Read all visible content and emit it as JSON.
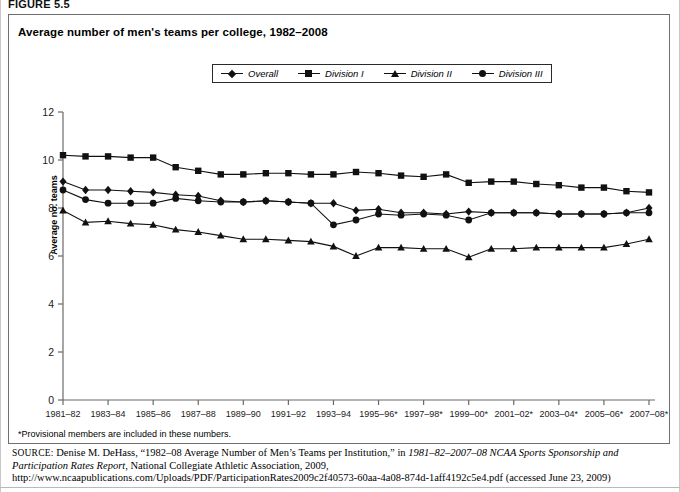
{
  "figure_label": "FIGURE 5.5",
  "chart_title": "Average number of men's teams per college, 1982–2008",
  "footnote": "*Provisional members are included in these numbers.",
  "source": {
    "label": "SOURCE:",
    "text_1": " Denise M. DeHass, “1982–08 Average Number of Men’s Teams per Institution,” in ",
    "italic_1": "1981–82–2007–08 NCAA Sports Sponsorship and Participation Rates Report",
    "text_2": ", National Collegiate Athletic Association, 2009, http://www.ncaapublications.com/Uploads/PDF/ParticipationRates2009c2f40573-60aa-4a08-874d-1aff4192c5e4.pdf (accessed June 23, 2009)"
  },
  "legend": {
    "items": [
      {
        "label": "Overall",
        "marker": "diamond-marker"
      },
      {
        "label": "Division I",
        "marker": "square-marker"
      },
      {
        "label": "Division II",
        "marker": "triangle-marker"
      },
      {
        "label": "Division III",
        "marker": "circle-marker"
      }
    ]
  },
  "chart_data": {
    "type": "line",
    "title": "Average number of men's teams per college, 1982–2008",
    "xlabel": "",
    "ylabel": "Average no. teams",
    "ylim": [
      0,
      12
    ],
    "yticks": [
      0,
      2,
      4,
      6,
      8,
      10,
      12
    ],
    "grid": false,
    "legend_position": "top-center",
    "x": [
      "1981–82",
      "1982–83",
      "1983–84",
      "1984–85",
      "1985–86",
      "1986–87",
      "1987–88",
      "1988–89",
      "1989–90",
      "1990–91",
      "1991–92",
      "1992–93",
      "1993–94",
      "1994–95",
      "1995–96*",
      "1996–97*",
      "1997–98*",
      "1998–99*",
      "1999–00*",
      "2000–01*",
      "2001–02*",
      "2002–03*",
      "2003–04*",
      "2004–05*",
      "2005–06*",
      "2006–07*",
      "2007–08*"
    ],
    "xtick_labels": [
      "1981–82",
      "1983–84",
      "1985–86",
      "1987–88",
      "1989–90",
      "1991–92",
      "1993–94",
      "1995–96*",
      "1997–98*",
      "1999–00*",
      "2001–02*",
      "2003–04*",
      "2005–06*",
      "2007–08*"
    ],
    "xtick_indices": [
      0,
      2,
      4,
      6,
      8,
      10,
      12,
      14,
      16,
      18,
      20,
      22,
      24,
      26
    ],
    "series": [
      {
        "name": "Overall",
        "marker": "diamond",
        "values": [
          9.1,
          8.75,
          8.75,
          8.7,
          8.65,
          8.55,
          8.5,
          8.3,
          8.25,
          8.3,
          8.25,
          8.2,
          8.2,
          7.9,
          7.95,
          7.8,
          7.8,
          7.75,
          7.85,
          7.8,
          7.8,
          7.8,
          7.75,
          7.75,
          7.75,
          7.8,
          8.0
        ]
      },
      {
        "name": "Division I",
        "marker": "square",
        "values": [
          10.2,
          10.15,
          10.15,
          10.1,
          10.1,
          9.7,
          9.55,
          9.4,
          9.4,
          9.45,
          9.45,
          9.4,
          9.4,
          9.5,
          9.45,
          9.35,
          9.3,
          9.4,
          9.05,
          9.1,
          9.1,
          9.0,
          8.95,
          8.85,
          8.85,
          8.7,
          8.65
        ]
      },
      {
        "name": "Division II",
        "marker": "triangle",
        "values": [
          7.9,
          7.4,
          7.45,
          7.35,
          7.3,
          7.1,
          7.0,
          6.85,
          6.7,
          6.7,
          6.65,
          6.6,
          6.4,
          6.0,
          6.35,
          6.35,
          6.3,
          6.3,
          5.95,
          6.3,
          6.3,
          6.35,
          6.35,
          6.35,
          6.35,
          6.5,
          6.7
        ]
      },
      {
        "name": "Division III",
        "marker": "circle",
        "values": [
          8.75,
          8.35,
          8.2,
          8.2,
          8.2,
          8.4,
          8.3,
          8.25,
          8.25,
          8.3,
          8.25,
          8.2,
          7.3,
          7.5,
          7.75,
          7.7,
          7.75,
          7.7,
          7.5,
          7.8,
          7.8,
          7.8,
          7.75,
          7.75,
          7.75,
          7.8,
          7.8
        ]
      }
    ]
  }
}
